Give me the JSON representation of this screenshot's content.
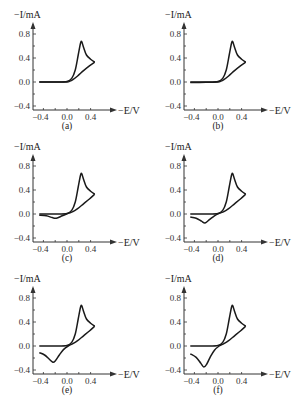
{
  "figure": {
    "ylabel": "−I/mA",
    "xlabel": "−E/V",
    "x_ticks": [
      "−0.4",
      "0.0",
      "0.4"
    ],
    "y_ticks": [
      "0.8",
      "0.4",
      "0.0",
      "−0.4"
    ],
    "line_color": "#1a1a1a",
    "axis_color": "#333333"
  },
  "chart_data": [
    {
      "type": "line",
      "panel": "(a)",
      "title": "",
      "xlabel": "−E/V",
      "ylabel": "−I/mA",
      "xlim": [
        -0.5,
        0.55
      ],
      "ylim": [
        -0.45,
        0.9
      ],
      "x_ticks": [
        -0.4,
        0.0,
        0.4
      ],
      "y_ticks": [
        -0.4,
        0.0,
        0.4,
        0.8
      ],
      "grid": false,
      "legend": null,
      "series": [
        {
          "name": "forward scan",
          "points": [
            [
              -0.47,
              0.0
            ],
            [
              -0.2,
              0.0
            ],
            [
              0.0,
              0.01
            ],
            [
              0.08,
              0.06
            ],
            [
              0.14,
              0.2
            ],
            [
              0.19,
              0.45
            ],
            [
              0.23,
              0.65
            ],
            [
              0.25,
              0.67
            ],
            [
              0.28,
              0.58
            ],
            [
              0.33,
              0.45
            ],
            [
              0.4,
              0.38
            ],
            [
              0.47,
              0.33
            ]
          ]
        },
        {
          "name": "reverse scan",
          "points": [
            [
              0.47,
              0.33
            ],
            [
              0.38,
              0.27
            ],
            [
              0.28,
              0.19
            ],
            [
              0.18,
              0.1
            ],
            [
              0.1,
              0.04
            ],
            [
              0.04,
              0.01
            ],
            [
              0.0,
              0.0
            ],
            [
              -0.2,
              0.0
            ],
            [
              -0.47,
              0.0
            ]
          ]
        }
      ]
    },
    {
      "type": "line",
      "panel": "(b)",
      "title": "",
      "xlabel": "−E/V",
      "ylabel": "−I/mA",
      "xlim": [
        -0.5,
        0.55
      ],
      "ylim": [
        -0.45,
        0.9
      ],
      "x_ticks": [
        -0.4,
        0.0,
        0.4
      ],
      "y_ticks": [
        -0.4,
        0.0,
        0.4,
        0.8
      ],
      "grid": false,
      "legend": null,
      "series": [
        {
          "name": "forward scan",
          "points": [
            [
              -0.47,
              0.0
            ],
            [
              -0.2,
              0.0
            ],
            [
              0.0,
              0.01
            ],
            [
              0.08,
              0.06
            ],
            [
              0.14,
              0.2
            ],
            [
              0.19,
              0.45
            ],
            [
              0.23,
              0.65
            ],
            [
              0.25,
              0.67
            ],
            [
              0.28,
              0.58
            ],
            [
              0.33,
              0.45
            ],
            [
              0.4,
              0.38
            ],
            [
              0.47,
              0.33
            ]
          ]
        },
        {
          "name": "reverse scan",
          "points": [
            [
              0.47,
              0.33
            ],
            [
              0.38,
              0.27
            ],
            [
              0.28,
              0.19
            ],
            [
              0.18,
              0.1
            ],
            [
              0.1,
              0.04
            ],
            [
              0.04,
              0.01
            ],
            [
              0.0,
              0.0
            ],
            [
              -0.2,
              -0.005
            ],
            [
              -0.47,
              -0.01
            ]
          ]
        }
      ]
    },
    {
      "type": "line",
      "panel": "(c)",
      "title": "",
      "xlabel": "−E/V",
      "ylabel": "−I/mA",
      "xlim": [
        -0.5,
        0.55
      ],
      "ylim": [
        -0.45,
        0.9
      ],
      "x_ticks": [
        -0.4,
        0.0,
        0.4
      ],
      "y_ticks": [
        -0.4,
        0.0,
        0.4,
        0.8
      ],
      "grid": false,
      "legend": null,
      "series": [
        {
          "name": "forward scan",
          "points": [
            [
              -0.47,
              0.0
            ],
            [
              -0.2,
              0.0
            ],
            [
              0.0,
              0.01
            ],
            [
              0.08,
              0.06
            ],
            [
              0.14,
              0.2
            ],
            [
              0.19,
              0.45
            ],
            [
              0.23,
              0.65
            ],
            [
              0.25,
              0.67
            ],
            [
              0.28,
              0.58
            ],
            [
              0.33,
              0.45
            ],
            [
              0.4,
              0.38
            ],
            [
              0.47,
              0.33
            ]
          ]
        },
        {
          "name": "reverse scan",
          "points": [
            [
              0.47,
              0.33
            ],
            [
              0.38,
              0.25
            ],
            [
              0.28,
              0.17
            ],
            [
              0.18,
              0.09
            ],
            [
              0.1,
              0.04
            ],
            [
              0.02,
              0.01
            ],
            [
              -0.08,
              -0.03
            ],
            [
              -0.18,
              -0.07
            ],
            [
              -0.25,
              -0.06
            ],
            [
              -0.35,
              -0.03
            ],
            [
              -0.47,
              -0.02
            ]
          ]
        }
      ]
    },
    {
      "type": "line",
      "panel": "(d)",
      "title": "",
      "xlabel": "−E/V",
      "ylabel": "−I/mA",
      "xlim": [
        -0.5,
        0.55
      ],
      "ylim": [
        -0.45,
        0.9
      ],
      "x_ticks": [
        -0.4,
        0.0,
        0.4
      ],
      "y_ticks": [
        -0.4,
        0.0,
        0.4,
        0.8
      ],
      "grid": false,
      "legend": null,
      "series": [
        {
          "name": "forward scan",
          "points": [
            [
              -0.47,
              0.0
            ],
            [
              -0.2,
              0.0
            ],
            [
              0.0,
              0.01
            ],
            [
              0.08,
              0.06
            ],
            [
              0.14,
              0.2
            ],
            [
              0.19,
              0.45
            ],
            [
              0.23,
              0.65
            ],
            [
              0.25,
              0.67
            ],
            [
              0.28,
              0.58
            ],
            [
              0.33,
              0.45
            ],
            [
              0.4,
              0.38
            ],
            [
              0.47,
              0.33
            ]
          ]
        },
        {
          "name": "reverse scan",
          "points": [
            [
              0.47,
              0.33
            ],
            [
              0.38,
              0.25
            ],
            [
              0.28,
              0.17
            ],
            [
              0.18,
              0.09
            ],
            [
              0.1,
              0.04
            ],
            [
              0.02,
              0.01
            ],
            [
              -0.06,
              -0.03
            ],
            [
              -0.14,
              -0.09
            ],
            [
              -0.22,
              -0.15
            ],
            [
              -0.28,
              -0.12
            ],
            [
              -0.37,
              -0.07
            ],
            [
              -0.47,
              -0.05
            ]
          ]
        }
      ]
    },
    {
      "type": "line",
      "panel": "(e)",
      "title": "",
      "xlabel": "−E/V",
      "ylabel": "−I/mA",
      "xlim": [
        -0.5,
        0.55
      ],
      "ylim": [
        -0.45,
        0.9
      ],
      "x_ticks": [
        -0.4,
        0.0,
        0.4
      ],
      "y_ticks": [
        -0.4,
        0.0,
        0.4,
        0.8
      ],
      "grid": false,
      "legend": null,
      "series": [
        {
          "name": "forward scan",
          "points": [
            [
              -0.47,
              0.0
            ],
            [
              -0.2,
              0.0
            ],
            [
              0.0,
              0.01
            ],
            [
              0.08,
              0.06
            ],
            [
              0.14,
              0.2
            ],
            [
              0.19,
              0.45
            ],
            [
              0.23,
              0.65
            ],
            [
              0.25,
              0.67
            ],
            [
              0.28,
              0.58
            ],
            [
              0.33,
              0.45
            ],
            [
              0.4,
              0.38
            ],
            [
              0.47,
              0.33
            ]
          ]
        },
        {
          "name": "reverse scan",
          "points": [
            [
              0.47,
              0.33
            ],
            [
              0.38,
              0.25
            ],
            [
              0.28,
              0.17
            ],
            [
              0.18,
              0.09
            ],
            [
              0.1,
              0.04
            ],
            [
              0.02,
              0.0
            ],
            [
              -0.06,
              -0.06
            ],
            [
              -0.13,
              -0.15
            ],
            [
              -0.2,
              -0.25
            ],
            [
              -0.24,
              -0.27
            ],
            [
              -0.3,
              -0.22
            ],
            [
              -0.38,
              -0.15
            ],
            [
              -0.47,
              -0.11
            ]
          ]
        }
      ]
    },
    {
      "type": "line",
      "panel": "(f)",
      "title": "",
      "xlabel": "−E/V",
      "ylabel": "−I/mA",
      "xlim": [
        -0.5,
        0.55
      ],
      "ylim": [
        -0.45,
        0.9
      ],
      "x_ticks": [
        -0.4,
        0.0,
        0.4
      ],
      "y_ticks": [
        -0.4,
        0.0,
        0.4,
        0.8
      ],
      "grid": false,
      "legend": null,
      "series": [
        {
          "name": "forward scan",
          "points": [
            [
              -0.47,
              0.0
            ],
            [
              -0.2,
              0.0
            ],
            [
              0.0,
              0.01
            ],
            [
              0.08,
              0.06
            ],
            [
              0.14,
              0.2
            ],
            [
              0.19,
              0.45
            ],
            [
              0.23,
              0.65
            ],
            [
              0.25,
              0.67
            ],
            [
              0.28,
              0.58
            ],
            [
              0.33,
              0.45
            ],
            [
              0.4,
              0.38
            ],
            [
              0.47,
              0.33
            ]
          ]
        },
        {
          "name": "reverse scan",
          "points": [
            [
              0.47,
              0.33
            ],
            [
              0.38,
              0.25
            ],
            [
              0.28,
              0.17
            ],
            [
              0.18,
              0.09
            ],
            [
              0.1,
              0.04
            ],
            [
              0.02,
              0.0
            ],
            [
              -0.06,
              -0.07
            ],
            [
              -0.13,
              -0.18
            ],
            [
              -0.19,
              -0.3
            ],
            [
              -0.24,
              -0.35
            ],
            [
              -0.29,
              -0.29
            ],
            [
              -0.37,
              -0.19
            ],
            [
              -0.47,
              -0.13
            ]
          ]
        }
      ]
    }
  ]
}
